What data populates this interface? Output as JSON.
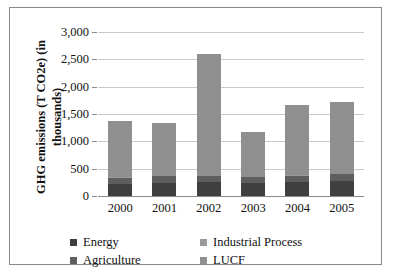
{
  "chart_data": {
    "type": "bar",
    "subtype": "stacked-column",
    "title": "",
    "xlabel": "",
    "ylabel": "GHG emissions (T CO2e) (in thousands)",
    "categories": [
      "2000",
      "2001",
      "2002",
      "2003",
      "2004",
      "2005"
    ],
    "ylim": [
      0,
      3000
    ],
    "yticks": [
      0,
      500,
      1000,
      1500,
      2000,
      2500,
      3000
    ],
    "ytick_labels": [
      "0",
      "500",
      "1,000",
      "1,500",
      "2,000",
      "2,500",
      "3,000"
    ],
    "grid": true,
    "legend_position": "bottom",
    "series": [
      {
        "name": "Energy",
        "color": "#3f3f3f",
        "values": [
          220,
          245,
          250,
          230,
          260,
          275
        ]
      },
      {
        "name": "Agriculture",
        "color": "#5e5e5e",
        "values": [
          110,
          115,
          110,
          110,
          115,
          120
        ]
      },
      {
        "name": "Industrial Process",
        "color": "#9a9a9a",
        "values": [
          10,
          10,
          10,
          10,
          10,
          10
        ]
      },
      {
        "name": "LUCF",
        "color": "#8f8f8f",
        "values": [
          1040,
          975,
          2220,
          830,
          1280,
          1315
        ]
      }
    ],
    "totals": [
      1380,
      1345,
      2590,
      1180,
      1665,
      1720
    ]
  },
  "axis": {
    "y_title_line1": "GHG emissions (T CO2e) (in",
    "y_title_line2": "thousands)"
  },
  "legend": {
    "items": [
      {
        "label": "Energy",
        "color": "#3f3f3f"
      },
      {
        "label": "Industrial Process",
        "color": "#9a9a9a"
      },
      {
        "label": "Agriculture",
        "color": "#5e5e5e"
      },
      {
        "label": "LUCF",
        "color": "#8f8f8f"
      }
    ]
  },
  "colors": {
    "gridline": "#c9c9c9",
    "axis": "#8a8a8a",
    "border": "#8a8a8a",
    "background": "#ffffff",
    "text": "#111111"
  }
}
